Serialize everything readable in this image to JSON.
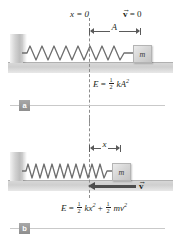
{
  "figure": {
    "panels": [
      {
        "key": "a",
        "badge": "a",
        "labels": {
          "origin": "x = 0",
          "velocity": "v = 0",
          "velocity_symbol": "v",
          "velocity_value": "= 0",
          "amplitude": "A",
          "block": "m"
        },
        "equation": {
          "lhs": "E",
          "eq": "=",
          "term1_num": "1",
          "term1_den": "2",
          "term1_body": "kA",
          "term1_exp": "2"
        },
        "state": "block at maximum displacement A, spring stretched, velocity zero"
      },
      {
        "key": "b",
        "badge": "b",
        "labels": {
          "displacement": "x",
          "block": "m",
          "velocity_symbol": "v"
        },
        "equation": {
          "lhs": "E",
          "eq": "=",
          "term1_num": "1",
          "term1_den": "2",
          "term1_body": "kx",
          "term1_exp": "2",
          "plus": "+",
          "term2_num": "1",
          "term2_den": "2",
          "term2_body": "mv",
          "term2_exp": "2"
        },
        "state": "block at displacement x moving left with speed v"
      }
    ],
    "colors": {
      "ink": "#231f20",
      "ground": "#d4d4d4",
      "wall": "#c6c6c6",
      "block": "#d7d7d7",
      "spring": "#6e6e6e",
      "dashed_line": "#8c8c8c",
      "arrow": "#5a5a5a",
      "velocity_arrow": "#4d4d4d",
      "badge": "#9a9a9a",
      "rule": "#c9c9c9"
    }
  }
}
